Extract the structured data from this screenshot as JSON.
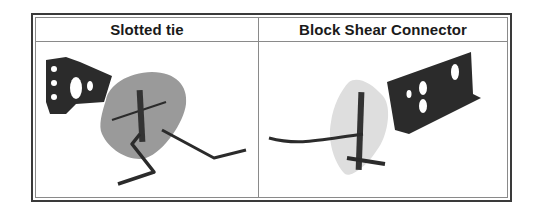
{
  "table": {
    "columns": [
      {
        "header": "Slotted tie",
        "image": "slotted-tie-photo"
      },
      {
        "header": "Block Shear Connector",
        "image": "block-shear-connector-photo"
      }
    ]
  },
  "colors": {
    "border_outer": "#3a3a3a",
    "border_inner": "#8a8a8a",
    "metal_dark": "#2b2b2b",
    "pad_gray": "#9a9a9a",
    "pad_light": "#dedede"
  }
}
